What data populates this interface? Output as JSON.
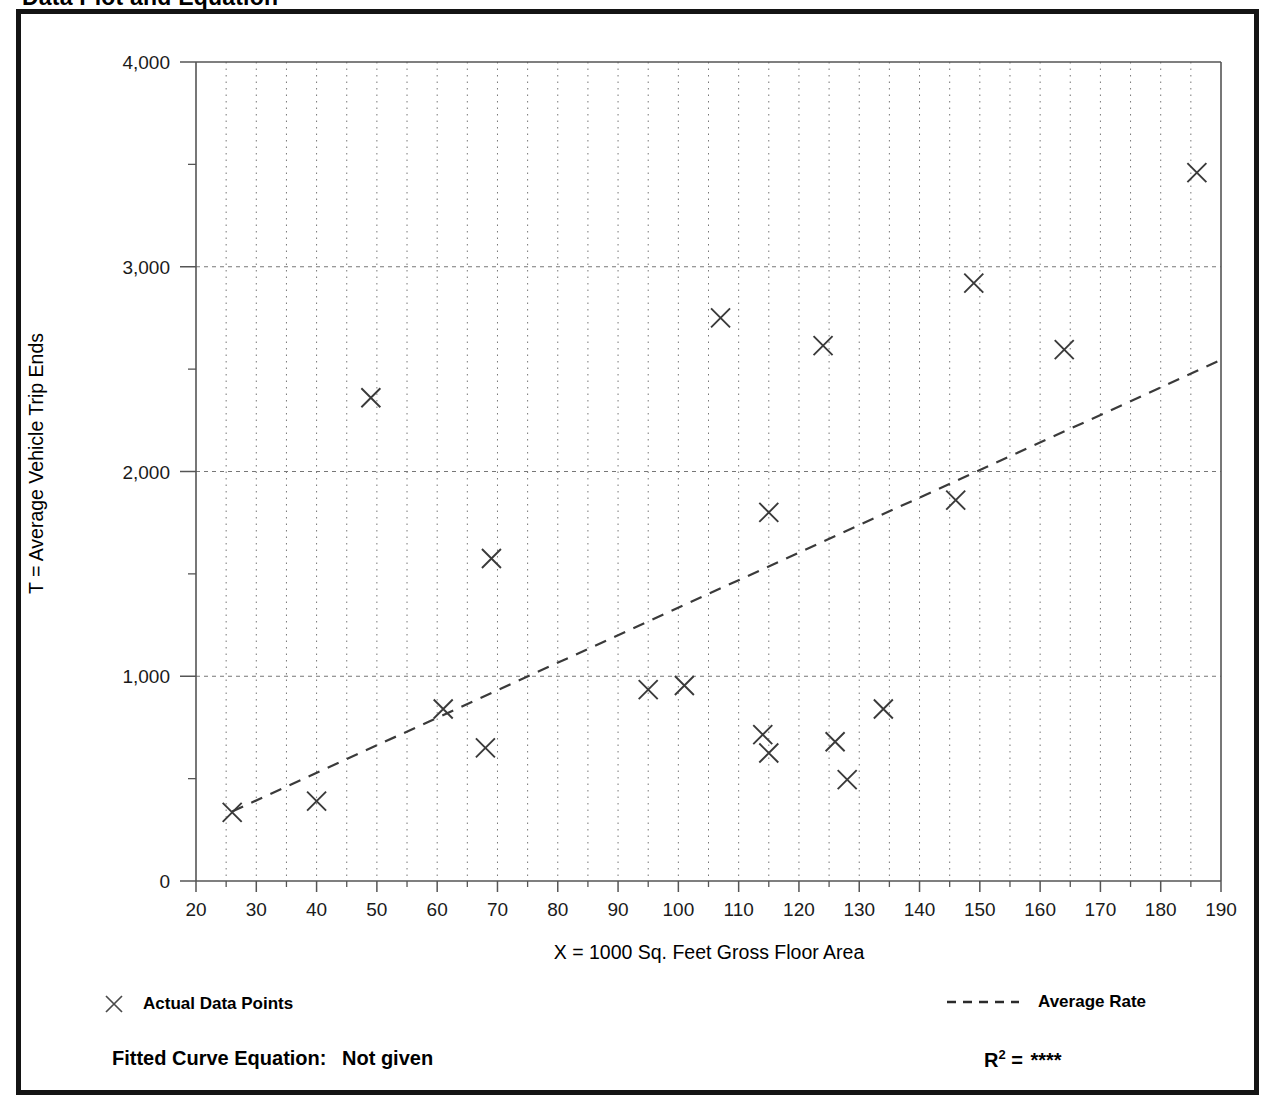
{
  "page": {
    "title": "Data Plot and Equation"
  },
  "legend": {
    "points_label": "Actual Data Points",
    "points_marker": "x-marker-icon",
    "rate_label": "Average Rate",
    "rate_marker": "dashed-line-icon"
  },
  "footer": {
    "equation_label": "Fitted Curve Equation:",
    "equation_value": "Not given",
    "r2_label": "R",
    "r2_exponent": "2",
    "r2_equals": "=",
    "r2_value": "****"
  },
  "colors": {
    "frame": "#141414",
    "axis": "#555555",
    "grid": "#777777",
    "marker": "#3a3a3a",
    "trend": "#3a3a3a",
    "text": "#000000"
  },
  "chart_data": {
    "type": "scatter",
    "title": "Data Plot and Equation",
    "xlabel": "X = 1000 Sq. Feet Gross Floor Area",
    "ylabel": "T = Average Vehicle Trip Ends",
    "xlim": [
      20,
      190
    ],
    "ylim": [
      0,
      4000
    ],
    "xticks": [
      20,
      30,
      40,
      50,
      60,
      70,
      80,
      90,
      100,
      110,
      120,
      130,
      140,
      150,
      160,
      170,
      180,
      190
    ],
    "xtick_labels": [
      "20",
      "30",
      "40",
      "50",
      "60",
      "70",
      "80",
      "90",
      "100",
      "110",
      "120",
      "130",
      "140",
      "150",
      "160",
      "170",
      "180",
      "190"
    ],
    "x_minor_step": 5,
    "yticks": [
      0,
      1000,
      2000,
      3000,
      4000
    ],
    "ytick_labels": [
      "0",
      "1,000",
      "2,000",
      "3,000",
      "4,000"
    ],
    "y_minor_step": 500,
    "grid": true,
    "grid_style": "dotted",
    "legend_position": "below-plot",
    "series": [
      {
        "name": "Actual Data Points",
        "type": "scatter",
        "marker": "x",
        "points": [
          [
            26,
            335
          ],
          [
            40,
            390
          ],
          [
            49,
            2360
          ],
          [
            61,
            840
          ],
          [
            68,
            650
          ],
          [
            69,
            1575
          ],
          [
            95,
            935
          ],
          [
            101,
            955
          ],
          [
            107,
            2750
          ],
          [
            114,
            715
          ],
          [
            115,
            625
          ],
          [
            115,
            1800
          ],
          [
            124,
            2615
          ],
          [
            126,
            680
          ],
          [
            128,
            495
          ],
          [
            134,
            840
          ],
          [
            146,
            1860
          ],
          [
            149,
            2920
          ],
          [
            164,
            2595
          ],
          [
            186,
            3460
          ]
        ]
      },
      {
        "name": "Average Rate",
        "type": "line",
        "style": "dashed",
        "points": [
          [
            26,
            340
          ],
          [
            190,
            2545
          ]
        ]
      }
    ]
  }
}
